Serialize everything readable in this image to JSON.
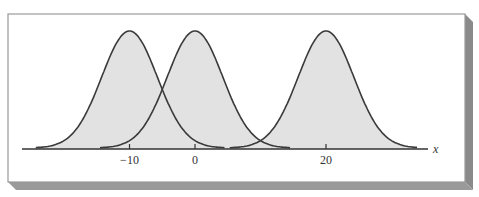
{
  "chart_data": {
    "type": "line",
    "title": "",
    "xlabel": "x",
    "ylabel": "",
    "x_ticks": [
      -10,
      0,
      20
    ],
    "x_tick_labels": [
      "−10",
      "0",
      "20"
    ],
    "xlim": [
      -26,
      36
    ],
    "grid": false,
    "legend": null,
    "shaded_under_curves": true,
    "series": [
      {
        "name": "curve-mean-neg10",
        "distribution": "normal",
        "mean": -10,
        "sd": 4.25,
        "x_range": [
          -24.3,
          4.6
        ]
      },
      {
        "name": "curve-mean-0",
        "distribution": "normal",
        "mean": 0,
        "sd": 4.25,
        "x_range": [
          -14.5,
          14.5
        ]
      },
      {
        "name": "curve-mean-20",
        "distribution": "normal",
        "mean": 20,
        "sd": 4.25,
        "x_range": [
          5.3,
          34
        ]
      }
    ],
    "colors": {
      "curve": "#3a3a3a",
      "fill": "#e2e2e2",
      "axis": "#333333",
      "frame_shadow": "#8a8a8a"
    }
  },
  "axis": {
    "x_label": "x",
    "ticks": [
      {
        "value": -10,
        "label": "−10"
      },
      {
        "value": 0,
        "label": "0"
      },
      {
        "value": 20,
        "label": "20"
      }
    ]
  }
}
